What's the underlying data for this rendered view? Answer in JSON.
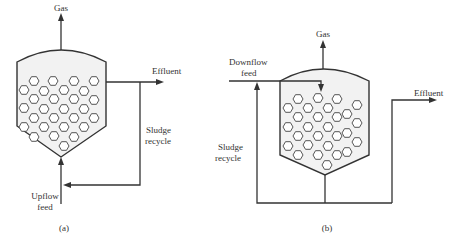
{
  "diagram_a": {
    "caption": "(a)",
    "labels": {
      "gas": "Gas",
      "effluent": "Effluent",
      "sludge_recycle_line1": "Sludge",
      "sludge_recycle_line2": "recycle",
      "feed_line1": "Upflow",
      "feed_line2": "feed"
    }
  },
  "diagram_b": {
    "caption": "(b)",
    "labels": {
      "gas": "Gas",
      "effluent": "Effluent",
      "sludge_recycle_line1": "Sludge",
      "sludge_recycle_line2": "recycle",
      "feed_line1": "Downflow",
      "feed_line2": "feed"
    }
  },
  "colors": {
    "line": "#333333",
    "vessel_fill": "#f2f2f2",
    "granule_fill": "#ffffff"
  }
}
